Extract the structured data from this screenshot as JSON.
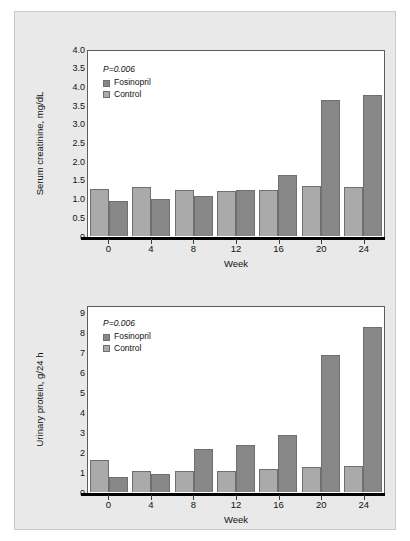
{
  "figure": {
    "background": "#e9e9e9",
    "panel_border": "#c9c9c9"
  },
  "colors": {
    "fosinopril": "#878787",
    "control": "#aaaaaa",
    "axis": "#000000",
    "frame": "#5d5d5d"
  },
  "legend": {
    "p_value": "P=0.006",
    "series": [
      {
        "label": "Fosinopril",
        "swatch": "#878787"
      },
      {
        "label": "Control",
        "swatch": "#aaaaaa"
      }
    ]
  },
  "chart_data": [
    {
      "type": "bar",
      "id": "serum-creatinine",
      "title": "",
      "xlabel": "Week",
      "ylabel": "Serum creatinine, mg/dL",
      "categories": [
        "0",
        "4",
        "8",
        "12",
        "16",
        "20",
        "24"
      ],
      "ytick_labels": [
        "4.0",
        "3.5",
        "4.0",
        "3.5",
        "3.0",
        "2.5",
        "2.0",
        "1.5",
        "1.0",
        "0.5",
        "0"
      ],
      "ytick_values": [
        5.0,
        4.5,
        4.0,
        3.5,
        3.0,
        2.5,
        2.0,
        1.5,
        1.0,
        0.5,
        0
      ],
      "ylim": [
        0,
        5.0
      ],
      "grid": false,
      "legend_position": "top-left",
      "annotation": "P=0.006",
      "series": [
        {
          "name": "Control",
          "values": [
            1.27,
            1.32,
            1.24,
            1.2,
            1.24,
            1.35,
            1.32
          ]
        },
        {
          "name": "Fosinopril",
          "values": [
            0.93,
            0.99,
            1.06,
            1.24,
            1.62,
            3.64,
            3.78
          ]
        }
      ]
    },
    {
      "type": "bar",
      "id": "urinary-protein",
      "title": "",
      "xlabel": "Week",
      "ylabel": "Urinary protein, g/24 h",
      "categories": [
        "0",
        "4",
        "8",
        "12",
        "16",
        "20",
        "24"
      ],
      "ytick_labels": [
        "9",
        "8",
        "7",
        "6",
        "5",
        "4",
        "3",
        "2",
        "1",
        "0"
      ],
      "ytick_values": [
        9,
        8,
        7,
        6,
        5,
        4,
        3,
        2,
        1,
        0
      ],
      "ylim": [
        0,
        9.4
      ],
      "grid": false,
      "legend_position": "top-left",
      "annotation": "P=0.006",
      "series": [
        {
          "name": "Control",
          "values": [
            1.62,
            1.05,
            1.07,
            1.08,
            1.14,
            1.24,
            1.29
          ]
        },
        {
          "name": "Fosinopril",
          "values": [
            0.74,
            0.91,
            2.16,
            2.36,
            2.86,
            6.88,
            8.32
          ]
        }
      ]
    }
  ]
}
